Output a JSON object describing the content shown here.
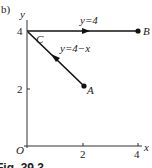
{
  "figure": {
    "part_label": "b)",
    "caption": "Fig. 39.3",
    "axes": {
      "x_label": "x",
      "y_label": "y",
      "origin_label": "O",
      "x_ticks": [
        "2",
        "4"
      ],
      "y_ticks": [
        "2",
        "4"
      ]
    },
    "points": {
      "A": {
        "label": "A",
        "x": 2,
        "y": 2
      },
      "B": {
        "label": "B",
        "x": 4,
        "y": 4
      },
      "C": {
        "label": "C",
        "x": 0,
        "y": 4
      }
    },
    "paths": [
      {
        "name": "A-to-C",
        "label": "y=4−x",
        "from": "A",
        "to": "C"
      },
      {
        "name": "C-to-B",
        "label": "y=4",
        "from": "C",
        "to": "B"
      }
    ]
  }
}
